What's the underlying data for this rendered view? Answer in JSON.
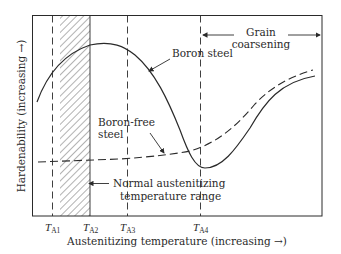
{
  "diagram": {
    "type": "line-diagram",
    "x_axis_label": "Austenitizing temperature (increasing →)",
    "y_axis_label": "Hardenability (increasing →)",
    "ticks": [
      {
        "main": "T",
        "sub": "A1"
      },
      {
        "main": "T",
        "sub": "A2"
      },
      {
        "main": "T",
        "sub": "A3"
      },
      {
        "main": "T",
        "sub": "A4"
      }
    ],
    "curves": {
      "boron_steel": {
        "label": "Boron steel",
        "style": "solid"
      },
      "boron_free": {
        "label_line1": "Boron-free",
        "label_line2": "steel",
        "style": "dashed"
      }
    },
    "annotations": {
      "grain_line1": "Grain",
      "grain_line2": "coarsening",
      "normal_line1": "Normal austenitizing",
      "normal_line2": "temperature range"
    },
    "colors": {
      "line": "#2a2a2a",
      "hatch": "#555555",
      "background": "#ffffff"
    }
  }
}
